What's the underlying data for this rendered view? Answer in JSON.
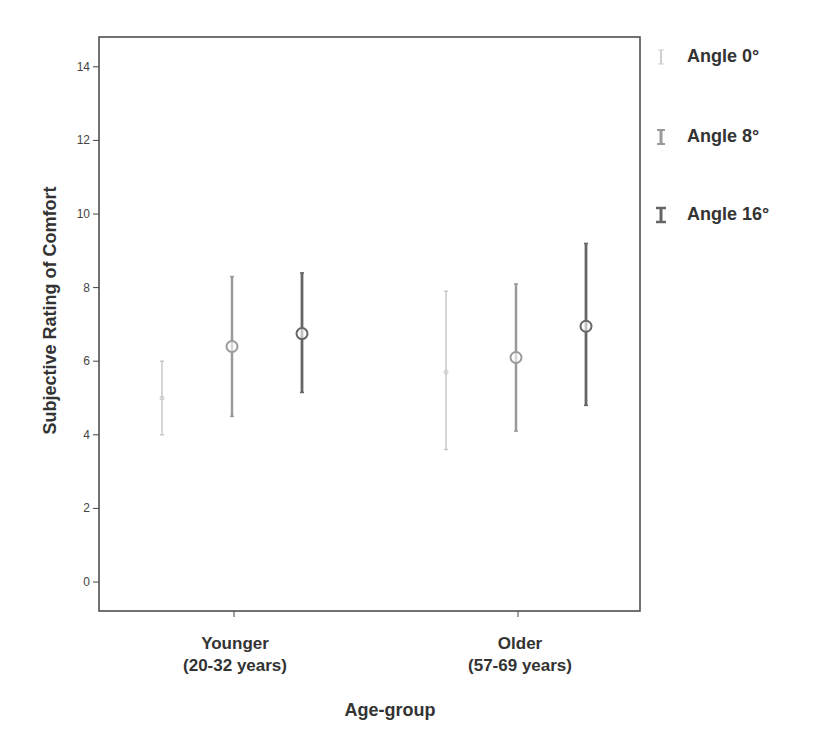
{
  "chart_data": {
    "type": "errorbar",
    "title": "",
    "xlabel": "Age-group",
    "ylabel": "Subjective Rating of Comfort",
    "ylim": [
      -0.8,
      14.8
    ],
    "yticks": [
      0,
      2,
      4,
      6,
      8,
      10,
      12,
      14
    ],
    "grid": false,
    "legend_position": "right",
    "categories": [
      {
        "line1": "Younger",
        "line2": "(20-32 years)"
      },
      {
        "line1": "Older",
        "line2": "(57-69 years)"
      }
    ],
    "series": [
      {
        "name": "Angle 0°",
        "color": "#c8c8c8",
        "means": [
          5.0,
          5.7
        ],
        "lower": [
          4.0,
          3.6
        ],
        "upper": [
          6.0,
          7.9
        ]
      },
      {
        "name": "Angle 8°",
        "color": "#9a9a9a",
        "means": [
          6.4,
          6.1
        ],
        "lower": [
          4.5,
          4.1
        ],
        "upper": [
          8.3,
          8.1
        ]
      },
      {
        "name": "Angle 16°",
        "color": "#666666",
        "means": [
          6.75,
          6.95
        ],
        "lower": [
          5.15,
          4.8
        ],
        "upper": [
          8.4,
          9.2
        ]
      }
    ]
  },
  "legend": {
    "items": [
      "Angle 0°",
      "Angle 8°",
      "Angle 16°"
    ]
  },
  "axes": {
    "xlabel": "Age-group",
    "ylabel": "Subjective Rating of Comfort",
    "categories": [
      {
        "line1": "Younger",
        "line2": "(20-32 years)"
      },
      {
        "line1": "Older",
        "line2": "(57-69 years)"
      }
    ]
  }
}
